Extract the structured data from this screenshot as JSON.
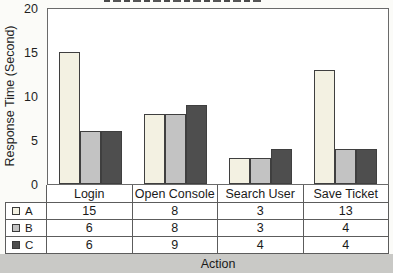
{
  "chart_data": {
    "type": "bar",
    "categories": [
      "Login",
      "Open Console",
      "Search User",
      "Save Ticket"
    ],
    "series": [
      {
        "name": "A",
        "values": [
          15,
          8,
          3,
          13
        ],
        "color": "#f3f1e2"
      },
      {
        "name": "B",
        "values": [
          6,
          8,
          3,
          4
        ],
        "color": "#c3c3c3"
      },
      {
        "name": "C",
        "values": [
          6,
          9,
          4,
          4
        ],
        "color": "#4e4e4e"
      }
    ],
    "xlabel": "Action",
    "ylabel": "Response Time (Second)",
    "ylim": [
      0,
      20
    ],
    "yticks": [
      0,
      5,
      10,
      15,
      20
    ],
    "grid": false,
    "legend_position": "data-table-left",
    "data_table_shown": true,
    "bar_border_color": "#3f3f3f",
    "plot_background": "#ffffff"
  }
}
